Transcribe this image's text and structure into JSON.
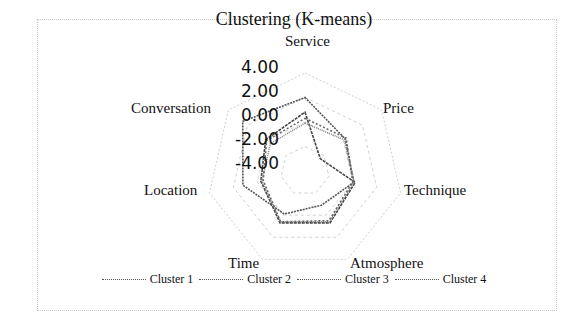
{
  "chart_data": {
    "type": "radar",
    "title": "Clustering (K-means)",
    "axes": [
      "Service",
      "Price",
      "Technique",
      "Atmosphere",
      "Time",
      "Location",
      "Conversation"
    ],
    "tick_labels": [
      "4.00",
      "2.00",
      "0.00",
      "-2.00",
      "-4.00"
    ],
    "range": [
      -4,
      4
    ],
    "grid": true,
    "legend_position": "bottom",
    "series": [
      {
        "name": "Cluster 1",
        "values": [
          2.0,
          0.2,
          0.1,
          -0.9,
          -0.1,
          1.2,
          2.5
        ],
        "color": "#555555"
      },
      {
        "name": "Cluster 2",
        "values": [
          0.8,
          -2.4,
          0.2,
          0.7,
          0.7,
          -0.3,
          0.1
        ],
        "color": "#444444"
      },
      {
        "name": "Cluster 3",
        "values": [
          -0.1,
          0.1,
          0.1,
          0.6,
          0.6,
          -0.4,
          -0.4
        ],
        "color": "#888888"
      },
      {
        "name": "Cluster 4",
        "values": [
          0.3,
          0.3,
          0.0,
          0.5,
          0.6,
          -0.5,
          0.0
        ],
        "color": "#666666"
      }
    ]
  },
  "legend": [
    "Cluster 1",
    "Cluster 2",
    "Cluster 3",
    "Cluster 4"
  ]
}
